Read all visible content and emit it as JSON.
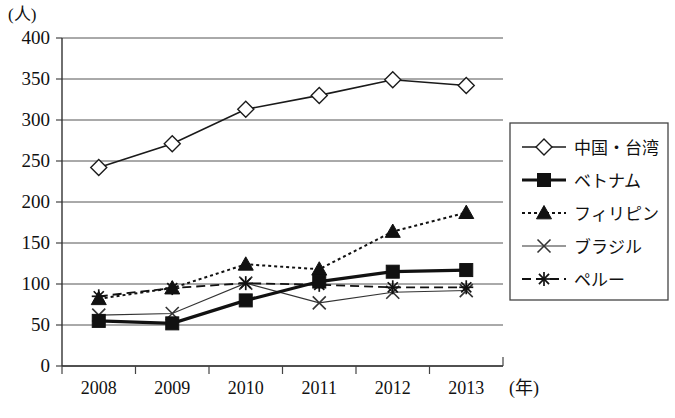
{
  "chart_data": {
    "type": "line",
    "title": "",
    "subtitle": "",
    "xlabel": "(年)",
    "ylabel": "(人)",
    "unit_label": "(人)",
    "x_unit_label": "(年)",
    "categories": [
      "2008",
      "2009",
      "2010",
      "2011",
      "2012",
      "2013"
    ],
    "x": [
      2008,
      2009,
      2010,
      2011,
      2012,
      2013
    ],
    "ylim": [
      0,
      400
    ],
    "y_ticks": [
      0,
      50,
      100,
      150,
      200,
      250,
      300,
      350,
      400
    ],
    "y_tick_labels": [
      "0",
      "50",
      "100",
      "150",
      "200",
      "250",
      "300",
      "350",
      "400"
    ],
    "grid": true,
    "grid_axis": "y",
    "legend_position": "right",
    "series": [
      {
        "name": "中国・台湾",
        "marker": "open-diamond",
        "line_style": "solid",
        "line_width": 1.6,
        "color": "#1a1a1a",
        "values": [
          242,
          271,
          313,
          330,
          349,
          342
        ]
      },
      {
        "name": "ベトナム",
        "marker": "filled-square",
        "line_style": "solid",
        "line_width": 3.2,
        "color": "#111111",
        "values": [
          55,
          52,
          80,
          103,
          115,
          117
        ]
      },
      {
        "name": "フィリピン",
        "marker": "filled-triangle",
        "line_style": "dotted",
        "line_width": 2,
        "color": "#111111",
        "values": [
          82,
          95,
          124,
          118,
          164,
          187
        ]
      },
      {
        "name": "ブラジル",
        "marker": "cross-x",
        "line_style": "solid",
        "line_width": 1.1,
        "color": "#333333",
        "values": [
          62,
          64,
          101,
          77,
          90,
          92
        ]
      },
      {
        "name": "ペルー",
        "marker": "asterisk",
        "line_style": "dashed",
        "line_width": 1.8,
        "color": "#111111",
        "values": [
          85,
          95,
          101,
          99,
          96,
          96
        ]
      }
    ]
  },
  "legend": {
    "items": [
      {
        "label": "中国・台湾"
      },
      {
        "label": "ベトナム"
      },
      {
        "label": "フィリピン"
      },
      {
        "label": "ブラジル"
      },
      {
        "label": "ペルー"
      }
    ]
  },
  "axes": {
    "y_unit": "(人)",
    "x_unit": "(年)",
    "y_labels": [
      "400",
      "350",
      "300",
      "250",
      "200",
      "150",
      "100",
      "50",
      "0"
    ],
    "x_labels": [
      "2008",
      "2009",
      "2010",
      "2011",
      "2012",
      "2013"
    ]
  }
}
